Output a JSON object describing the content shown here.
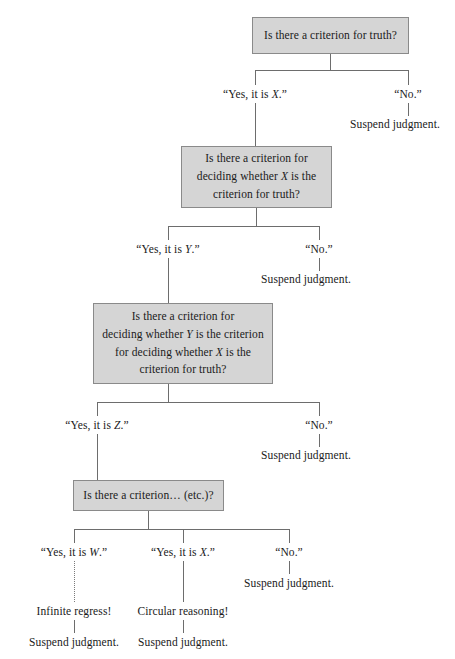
{
  "diagram": {
    "type": "flowchart",
    "box_fill": "#d5d5d5",
    "box_border": "#8a8a8a",
    "line_color": "#6d6d6d",
    "background": "#ffffff"
  },
  "boxes": {
    "level1": "Is there a criterion for truth?",
    "level2_line1": "Is there a criterion for",
    "level2_line2": "deciding whether X is the",
    "level2_line3": "criterion for truth?",
    "level3_line1": "Is there a criterion for",
    "level3_line2": "deciding whether Y is the criterion",
    "level3_line3": "for deciding whether X is the",
    "level3_line4": "criterion for truth?",
    "level4": "Is there a criterion… (etc.)?"
  },
  "branches": {
    "level1_yes": "“Yes, it is X.”",
    "level1_no": "“No.”",
    "level1_no_result": "Suspend judgment.",
    "level2_yes": "“Yes, it is Y.”",
    "level2_no": "“No.”",
    "level2_no_result": "Suspend judgment.",
    "level3_yes": "“Yes, it is Z.”",
    "level3_no": "“No.”",
    "level3_no_result": "Suspend judgment.",
    "level4_yes_w": "“Yes, it is W.”",
    "level4_yes_x": "“Yes, it is X.”",
    "level4_no": "“No.”",
    "level4_no_result": "Suspend judgment.",
    "infinite_regress": "Infinite regress!",
    "infinite_regress_result": "Suspend judgment.",
    "circular_reasoning": "Circular reasoning!",
    "circular_reasoning_result": "Suspend judgment."
  }
}
